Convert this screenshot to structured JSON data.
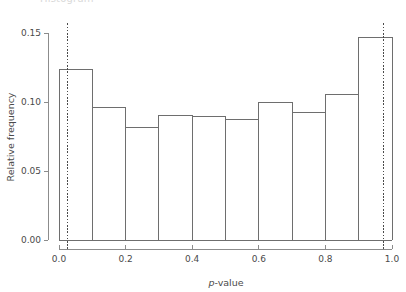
{
  "figure": {
    "clipped_header_text": "Histogram",
    "background_color": "#ffffff",
    "bar_stroke_color": "#6e6e6e",
    "axis_color": "#8c8c8c",
    "refline_color": "#4a4a4a"
  },
  "chart_data": {
    "type": "bar",
    "title": "",
    "subtitle": "",
    "xlabel": "p-value",
    "xlabel_italic_prefix": "p",
    "xlabel_rest": "-value",
    "ylabel": "Relative frequency",
    "xlim": [
      0.0,
      1.0
    ],
    "ylim": [
      0.0,
      0.155
    ],
    "grid": false,
    "legend": null,
    "bin_width": 0.1,
    "bin_edges": [
      0.0,
      0.1,
      0.2,
      0.3,
      0.4,
      0.5,
      0.6,
      0.7,
      0.8,
      0.9,
      1.0
    ],
    "categories": [
      "0.0-0.1",
      "0.1-0.2",
      "0.2-0.3",
      "0.3-0.4",
      "0.4-0.5",
      "0.5-0.6",
      "0.6-0.7",
      "0.7-0.8",
      "0.8-0.9",
      "0.9-1.0"
    ],
    "values": [
      0.1235,
      0.0963,
      0.0812,
      0.0903,
      0.0892,
      0.0873,
      0.0995,
      0.0923,
      0.1053,
      0.1465
    ],
    "xticks": [
      0.0,
      0.2,
      0.4,
      0.6,
      0.8,
      1.0
    ],
    "xtick_labels": [
      "0.0",
      "0.2",
      "0.4",
      "0.6",
      "0.8",
      "1.0"
    ],
    "xticks_minor": [
      0.1,
      0.3,
      0.5,
      0.7,
      0.9
    ],
    "yticks": [
      0.0,
      0.05,
      0.1,
      0.15
    ],
    "ytick_labels": [
      "0.00",
      "0.05",
      "0.10",
      "0.15"
    ],
    "annotations": [
      {
        "name": "lower-reference-line",
        "type": "vline",
        "x": 0.025,
        "style": "dotted"
      },
      {
        "name": "upper-reference-line",
        "type": "vline",
        "x": 0.975,
        "style": "dotted"
      }
    ]
  }
}
